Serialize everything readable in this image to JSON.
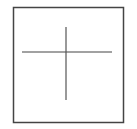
{
  "diagram": {
    "shapes": [
      {
        "kind": "rectangle",
        "role": "frame"
      },
      {
        "kind": "line",
        "role": "horizontal-bar"
      },
      {
        "kind": "line",
        "role": "vertical-bar"
      }
    ],
    "colors": {
      "stroke": "#444444",
      "background": "#ffffff"
    }
  }
}
